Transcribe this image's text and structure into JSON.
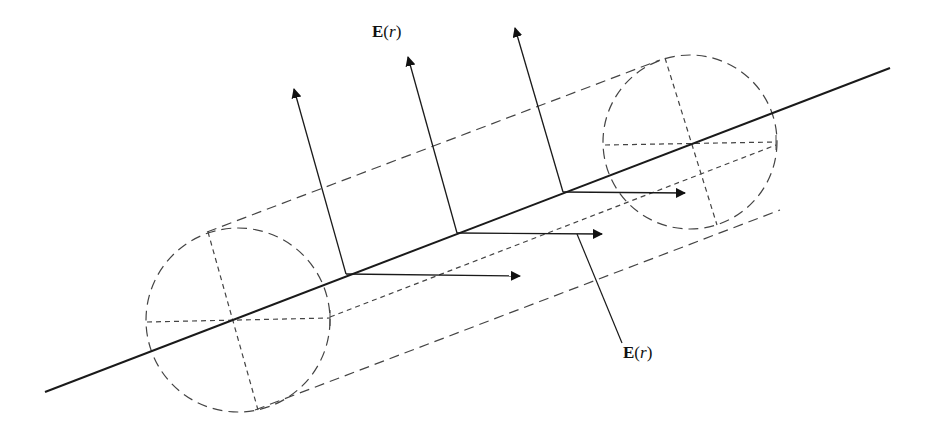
{
  "diagram": {
    "colors": {
      "stroke": "#1a1a1a",
      "dashed": "#444444",
      "background": "#ffffff"
    },
    "labels": [
      {
        "id": "field-label-top",
        "bold": "E",
        "open": "(",
        "var": "r",
        "close": ")",
        "x": 372,
        "y": 22
      },
      {
        "id": "field-label-bottom",
        "bold": "E",
        "open": "(",
        "var": "r",
        "close": ")",
        "x": 623,
        "y": 343
      }
    ],
    "line_charge": {
      "x1": 45,
      "y1": 392,
      "x2": 890,
      "y2": 68
    },
    "end_caps": [
      {
        "cx": 238,
        "cy": 320,
        "r": 92
      },
      {
        "cx": 690,
        "cy": 142,
        "r": 87
      }
    ],
    "perpendicular_arrows": [
      {
        "x1": 346,
        "y1": 274,
        "x2": 294,
        "y2": 89
      },
      {
        "x1": 457,
        "y1": 233,
        "x2": 408,
        "y2": 57
      },
      {
        "x1": 563,
        "y1": 192,
        "x2": 515,
        "y2": 28
      }
    ],
    "parallel_arrows": [
      {
        "x1": 346,
        "y1": 274,
        "x2": 520,
        "y2": 276
      },
      {
        "x1": 457,
        "y1": 233,
        "x2": 602,
        "y2": 234
      },
      {
        "x1": 563,
        "y1": 192,
        "x2": 685,
        "y2": 193
      }
    ],
    "leader_line": {
      "x1": 577,
      "y1": 234,
      "x2": 622,
      "y2": 343
    }
  }
}
